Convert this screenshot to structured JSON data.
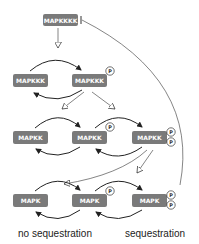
{
  "diagram": {
    "type": "MAPK signaling cascade",
    "colors": {
      "node_fill": "#7a7a7a",
      "node_text": "#ffffff",
      "arrow": "#222222",
      "phospho_outline": "#333333"
    },
    "nodes": {
      "mapkkkk": "MAPKKKK",
      "mapkkk": "MAPKKK",
      "mapkkk_p": "MAPKKK",
      "mapkk": "MAPKK",
      "mapkk_p": "MAPKK",
      "mapkk_pp": "MAPKK",
      "mapk": "MAPK",
      "mapk_p": "MAPK",
      "mapk_pp": "MAPK"
    },
    "phospho_label": "P",
    "labels": {
      "left": "no sequestration",
      "right": "sequestration"
    }
  }
}
